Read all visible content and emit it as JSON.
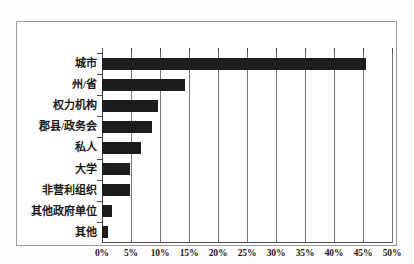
{
  "chart_data": {
    "type": "bar",
    "orientation": "horizontal",
    "title": "",
    "subtitle": "",
    "xlabel": "",
    "ylabel": "",
    "categories": [
      "城市",
      "州/省",
      "权力机构",
      "郡县/政务会",
      "私人",
      "大学",
      "非营利组织",
      "其他政府单位",
      "其他"
    ],
    "values": [
      45.5,
      14.3,
      9.6,
      8.7,
      6.7,
      4.8,
      4.8,
      1.8,
      1.0
    ],
    "unit": "%",
    "xlim": [
      0,
      50
    ],
    "xticks": [
      0,
      5,
      10,
      15,
      20,
      25,
      30,
      35,
      40,
      45,
      50
    ],
    "xtick_labels": [
      "0%",
      "5%",
      "10%",
      "15%",
      "20%",
      "25%",
      "30%",
      "35%",
      "40%",
      "45%",
      "50%"
    ],
    "grid": "vertical",
    "legend": null,
    "series": [
      {
        "name": "",
        "values": [
          45.5,
          14.3,
          9.6,
          8.7,
          6.7,
          4.8,
          4.8,
          1.8,
          1.0
        ]
      }
    ],
    "colors": {
      "bar": "#1c1c1c",
      "gridline": "#767676",
      "axis": "#3a3a3a",
      "frame": "#9b9b9b",
      "background": "#ffffff",
      "text": "#1a1a1a"
    }
  }
}
